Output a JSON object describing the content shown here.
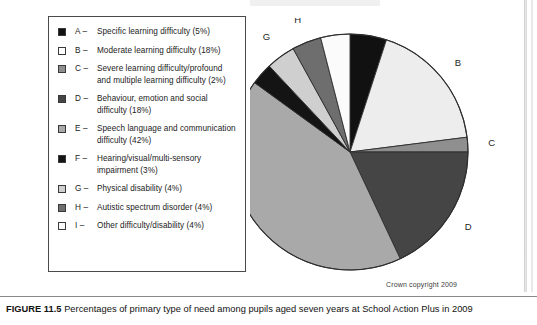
{
  "figure": {
    "caption_label": "FIGURE 11.5",
    "caption_text": "Percentages of primary type of need among pupils aged seven years at School Action Plus in 2009",
    "credit": "Crown copyright 2009"
  },
  "legend": {
    "items": [
      {
        "key": "A –",
        "label": "Specific learning difficulty (5%)",
        "swatch": "#111111"
      },
      {
        "key": "B –",
        "label": "Moderate learning difficulty (18%)",
        "swatch": "#fdfdfd"
      },
      {
        "key": "C –",
        "label": "Severe learning difficulty/profound and multiple learning difficulty (2%)",
        "swatch": "#8f8f8f"
      },
      {
        "key": "D –",
        "label": "Behaviour, emotion and social difficulty (18%)",
        "swatch": "#454545"
      },
      {
        "key": "E –",
        "label": "Speech language and communication difficulty (42%)",
        "swatch": "#a9a9a9"
      },
      {
        "key": "F –",
        "label": "Hearing/visual/multi-sensory impairment (3%)",
        "swatch": "#141414"
      },
      {
        "key": "G –",
        "label": "Physical disability (4%)",
        "swatch": "#cfcfcf"
      },
      {
        "key": "H –",
        "label": "Autistic spectrum disorder (4%)",
        "swatch": "#6e6e6e"
      },
      {
        "key": "I –",
        "label": "Other difficulty/disability (4%)",
        "swatch": "#fbfbfb"
      }
    ]
  },
  "chart_data": {
    "type": "pie",
    "title": "Percentages of primary type of need among pupils aged seven years at School Action Plus in 2009",
    "unit": "percent",
    "start_angle_deg": 0,
    "direction": "clockwise",
    "legend_position": "left",
    "grid": false,
    "categories": [
      "A",
      "B",
      "C",
      "D",
      "E",
      "F",
      "G",
      "H",
      "I"
    ],
    "values": [
      5,
      18,
      2,
      18,
      42,
      3,
      4,
      4,
      4
    ],
    "labels": [
      "Specific learning difficulty",
      "Moderate learning difficulty",
      "Severe learning difficulty/profound and multiple learning difficulty",
      "Behaviour, emotion and social difficulty",
      "Speech language and communication difficulty",
      "Hearing/visual/multi-sensory impairment",
      "Physical disability",
      "Autistic spectrum disorder",
      "Other difficulty/disability"
    ],
    "colors": [
      "#111111",
      "#ededed",
      "#8f8f8f",
      "#454545",
      "#a9a9a9",
      "#141414",
      "#cfcfcf",
      "#6e6e6e",
      "#fbfbfb"
    ],
    "slice_labels": [
      "A",
      "B",
      "C",
      "D",
      "E",
      "F",
      "G",
      "H",
      "I"
    ]
  }
}
